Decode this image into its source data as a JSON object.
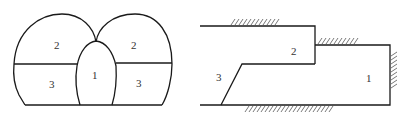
{
  "figure": {
    "left_diagram": {
      "description": "Twin-arch tunnel cross-section with central pilot drift",
      "regions": [
        {
          "id": "left-upper",
          "label": "2"
        },
        {
          "id": "left-lower",
          "label": "3"
        },
        {
          "id": "center",
          "label": "1"
        },
        {
          "id": "right-upper",
          "label": "2"
        },
        {
          "id": "right-lower",
          "label": "3"
        }
      ]
    },
    "right_diagram": {
      "description": "Longitudinal section showing excavation sequence with fixed boundaries",
      "regions": [
        {
          "id": "upper-bench",
          "label": "2"
        },
        {
          "id": "lower-bench",
          "label": "3"
        },
        {
          "id": "front-core",
          "label": "1"
        }
      ]
    }
  }
}
